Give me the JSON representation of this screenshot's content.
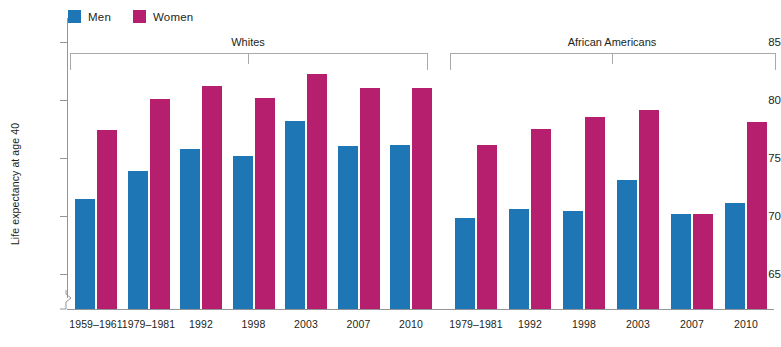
{
  "legend": {
    "items": [
      {
        "label": "Men",
        "color": "#1f76b4",
        "key": "men"
      },
      {
        "label": "Women",
        "color": "#b51f6e",
        "key": "women"
      }
    ]
  },
  "axis": {
    "ylabel": "Life expectancy at age 40",
    "yticks": [
      "65",
      "70",
      "75",
      "80",
      "85"
    ],
    "break_icon": "axis-break-zigzag"
  },
  "chart_data": {
    "type": "bar",
    "title": "",
    "xlabel": "",
    "ylabel": "Life expectancy at age 40",
    "ylim": [
      65,
      86
    ],
    "grid": false,
    "legend_position": "top-left",
    "axis_break": true,
    "groups": [
      {
        "name": "Whites",
        "categories": [
          "1959–1961",
          "1979–1981",
          "1992",
          "1998",
          "2003",
          "2007",
          "2010"
        ],
        "series": [
          {
            "name": "Men",
            "values": [
              71.5,
              73.9,
              75.8,
              75.2,
              78.2,
              76.0,
              76.1
            ]
          },
          {
            "name": "Women",
            "values": [
              77.4,
              80.1,
              81.2,
              80.2,
              82.2,
              81.0,
              81.0
            ]
          }
        ]
      },
      {
        "name": "African Americans",
        "categories": [
          "1979–1981",
          "1992",
          "1998",
          "2003",
          "2007",
          "2010"
        ],
        "series": [
          {
            "name": "Men",
            "values": [
              69.8,
              70.6,
              70.4,
              73.1,
              70.2,
              71.1
            ]
          },
          {
            "name": "Women",
            "values": [
              76.1,
              77.5,
              78.5,
              79.1,
              70.2,
              78.1
            ]
          }
        ]
      }
    ]
  }
}
